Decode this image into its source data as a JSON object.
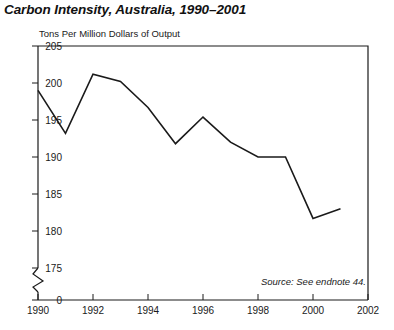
{
  "title": "Carbon Intensity, Australia, 1990–2001",
  "axis_note": "Tons Per Million Dollars of Output",
  "source_note": "Source: See endnote 44.",
  "chart_data": {
    "type": "line",
    "title": "Carbon Intensity, Australia, 1990–2001",
    "xlabel": "",
    "ylabel": "Tons Per Million Dollars of Output",
    "x": [
      1990,
      1991,
      1992,
      1993,
      1994,
      1995,
      1996,
      1997,
      1998,
      1999,
      2000,
      2001
    ],
    "values": [
      199.0,
      193.2,
      201.2,
      200.2,
      196.7,
      191.8,
      195.4,
      192.0,
      190.0,
      190.0,
      181.7,
      183.0
    ],
    "series": [
      {
        "name": "Carbon Intensity",
        "values": [
          199.0,
          193.2,
          201.2,
          200.2,
          196.7,
          191.8,
          195.4,
          192.0,
          190.0,
          190.0,
          181.7,
          183.0
        ]
      }
    ],
    "ylim": [
      175,
      205
    ],
    "xlim": [
      1990,
      2002
    ],
    "yticks": [
      205,
      200,
      195,
      190,
      185,
      180,
      175,
      0
    ],
    "xticks": [
      1990,
      1992,
      1994,
      1996,
      1998,
      2000,
      2002
    ],
    "axis_break": true,
    "axis_break_between": [
      0,
      175
    ],
    "grid": false,
    "legend": "none",
    "line_color": "#1a1a1a",
    "background": "#ffffff"
  },
  "ytick_labels": [
    "205",
    "200",
    "195",
    "190",
    "185",
    "180",
    "175",
    "0"
  ],
  "xtick_labels": [
    "1990",
    "1992",
    "1994",
    "1996",
    "1998",
    "2000",
    "2002"
  ]
}
